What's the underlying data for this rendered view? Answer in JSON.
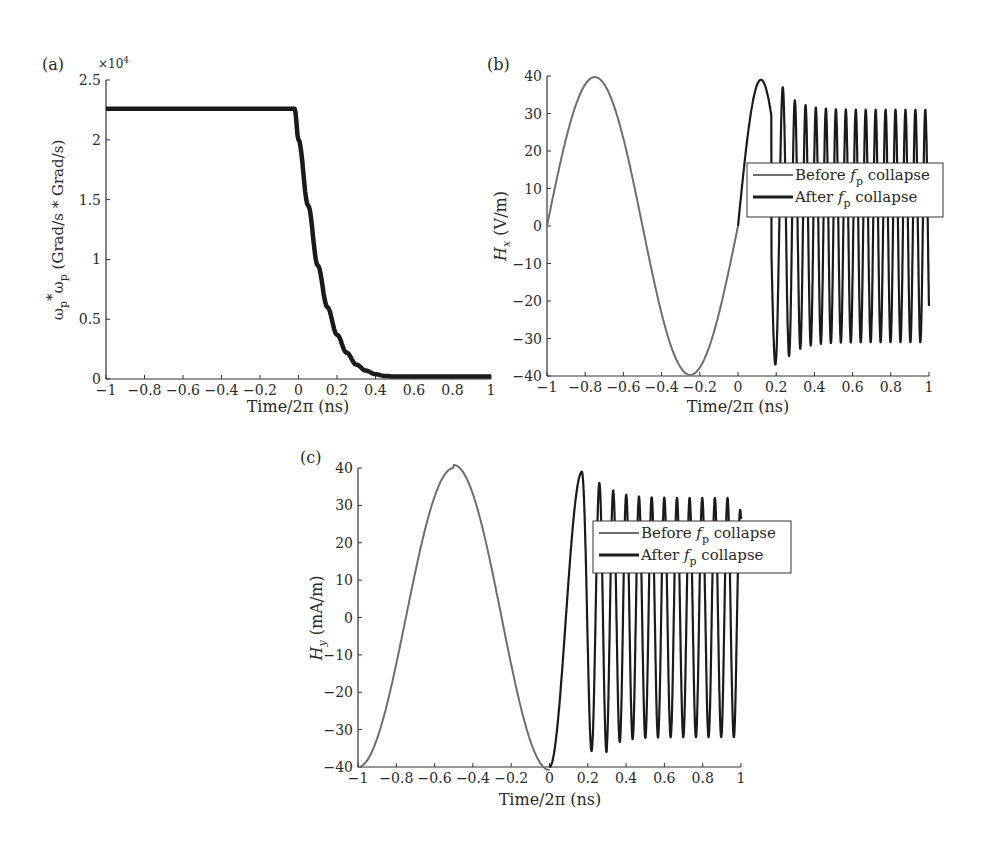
{
  "chart_data": [
    {
      "panel_label": "(a)",
      "type": "line",
      "title": "",
      "xlabel": "Time/2π (ns)",
      "ylabel": "ωp*ωp (Grad/s * Grad/s)",
      "y_multiplier": "×10⁴",
      "xlim": [
        -1,
        1
      ],
      "ylim": [
        0,
        2.5
      ],
      "xticks": [
        "-1",
        "-0.8",
        "-0.6",
        "-0.4",
        "-0.2",
        "0",
        "0.2",
        "0.4",
        "0.6",
        "0.8",
        "1"
      ],
      "yticks": [
        "0",
        "0.5",
        "1",
        "1.5",
        "2",
        "2.5"
      ],
      "grid": false,
      "legend": null,
      "series": [
        {
          "name": "ωp²",
          "x": [
            -1,
            -0.8,
            -0.6,
            -0.4,
            -0.2,
            -0.02,
            0.0,
            0.05,
            0.1,
            0.15,
            0.2,
            0.25,
            0.3,
            0.35,
            0.4,
            0.45,
            0.5,
            0.6,
            0.8,
            1.0
          ],
          "values": [
            2.26,
            2.26,
            2.26,
            2.26,
            2.26,
            2.26,
            2.0,
            1.45,
            0.95,
            0.6,
            0.37,
            0.22,
            0.12,
            0.07,
            0.04,
            0.025,
            0.02,
            0.02,
            0.02,
            0.02
          ]
        }
      ]
    },
    {
      "panel_label": "(b)",
      "type": "line",
      "title": "",
      "xlabel": "Time/2π (ns)",
      "ylabel": "Hx (V/m)",
      "xlim": [
        -1,
        1
      ],
      "ylim": [
        -40,
        40
      ],
      "xticks": [
        "-1",
        "-0.8",
        "-0.6",
        "-0.4",
        "-0.2",
        "0",
        "0.2",
        "0.4",
        "0.6",
        "0.8",
        "1"
      ],
      "yticks": [
        "-40",
        "-30",
        "-20",
        "-10",
        "0",
        "10",
        "20",
        "30",
        "40"
      ],
      "grid": false,
      "legend": {
        "position": "center-right",
        "entries": [
          "Before fp collapse",
          "After fp collapse"
        ]
      },
      "series": [
        {
          "name": "Before fp collapse",
          "color": "#6e6e6e",
          "x": [
            -1,
            -0.75,
            -0.5,
            -0.25,
            0
          ],
          "values": [
            0,
            39.5,
            0,
            -40,
            0
          ]
        },
        {
          "name": "After fp collapse",
          "color": "#1a1a1a",
          "description": "Peak 39 at ~0.12, trough -37 at ~0.23, then oscillations of ~±31 with period ~0.056 up to t=1",
          "x": [
            0,
            0.12,
            0.23,
            0.28,
            0.33,
            0.37,
            0.41,
            0.45,
            1.0
          ],
          "values": [
            0,
            39,
            -37,
            34.5,
            -33,
            32,
            -31.5,
            31,
            28
          ]
        }
      ]
    },
    {
      "panel_label": "(c)",
      "type": "line",
      "title": "",
      "xlabel": "Time/2π (ns)",
      "ylabel": "Hy (mA/m)",
      "xlim": [
        -1,
        1
      ],
      "ylim": [
        -40,
        40
      ],
      "xticks": [
        "-1",
        "-0.8",
        "-0.6",
        "-0.4",
        "-0.2",
        "0",
        "0.2",
        "0.4",
        "0.6",
        "0.8",
        "1"
      ],
      "yticks": [
        "-40",
        "-30",
        "-20",
        "-10",
        "0",
        "10",
        "20",
        "30",
        "40"
      ],
      "grid": false,
      "legend": {
        "position": "center-right",
        "entries": [
          "Before fp collapse",
          "After fp collapse"
        ]
      },
      "series": [
        {
          "name": "Before fp collapse",
          "color": "#6e6e6e",
          "x": [
            -1,
            -0.75,
            -0.5,
            -0.25,
            0
          ],
          "values": [
            -40,
            0,
            41,
            0,
            -40
          ]
        },
        {
          "name": "After fp collapse",
          "color": "#1a1a1a",
          "description": "Peak 39 at ~0.17, trough -35 at ~0.26, then oscillations of ~±32 with period ~0.068 up to ~0.97",
          "x": [
            0,
            0.17,
            0.26,
            0.3,
            0.35,
            0.4,
            0.44,
            0.97
          ],
          "values": [
            -40,
            39,
            -35,
            35,
            -32.5,
            33.5,
            -31.5,
            32
          ]
        }
      ]
    }
  ],
  "labels": {
    "a": {
      "panel": "(a)",
      "mult": "×10",
      "mult_exp": "4",
      "xlabel": "Time/2π (ns)",
      "ylabel_main": "ω",
      "ylabel_full": "ωp*ωp (Grad/s * Grad/s)"
    },
    "b": {
      "panel": "(b)",
      "xlabel": "Time/2π (ns)",
      "ylabel_var": "H",
      "ylabel_sub": "x",
      "ylabel_unit": " (V/m)"
    },
    "c": {
      "panel": "(c)",
      "xlabel": "Time/2π (ns)",
      "ylabel_var": "H",
      "ylabel_sub": "y",
      "ylabel_unit": " (mA/m)"
    },
    "legend": {
      "before_pre": "Before ",
      "f": "f",
      "p": "p",
      "post": " collapse",
      "after_pre": "After "
    }
  }
}
